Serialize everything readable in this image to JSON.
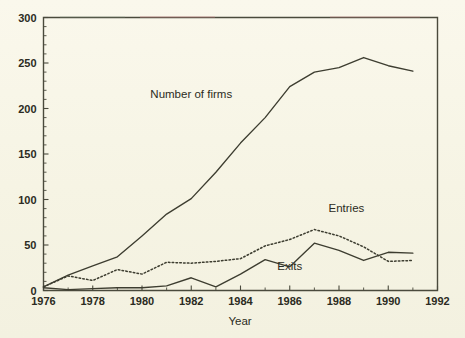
{
  "figure": {
    "background_color": "#f7f5e6",
    "ink_color": "#3d3d30",
    "axis_color": "#4a4a3c"
  },
  "chart_data": {
    "type": "line",
    "title": "",
    "xlabel": "Year",
    "ylabel": "",
    "xlim": [
      1976,
      1992
    ],
    "ylim": [
      0,
      300
    ],
    "grid": false,
    "legend_position": "inline-annotations",
    "x_tick_labels": [
      "1976",
      "1978",
      "1980",
      "1982",
      "1984",
      "1986",
      "1988",
      "1990",
      "1992"
    ],
    "x_tick_values": [
      1976,
      1978,
      1980,
      1982,
      1984,
      1986,
      1988,
      1990,
      1992
    ],
    "x_minor_tick_values": [
      1977,
      1979,
      1981,
      1983,
      1985,
      1987,
      1989,
      1991
    ],
    "y_tick_labels": [
      "0",
      "50",
      "100",
      "150",
      "200",
      "250",
      "300"
    ],
    "y_tick_values": [
      0,
      50,
      100,
      150,
      200,
      250,
      300
    ],
    "y_minor_tick_values": [
      10,
      20,
      30,
      40,
      60,
      70,
      80,
      90,
      110,
      120,
      130,
      140,
      160,
      170,
      180,
      190,
      210,
      220,
      230,
      240,
      260,
      270,
      280,
      290
    ],
    "x": [
      1976,
      1977,
      1978,
      1979,
      1980,
      1981,
      1982,
      1983,
      1984,
      1985,
      1986,
      1987,
      1988,
      1989,
      1990,
      1991
    ],
    "series": [
      {
        "name": "Number of firms",
        "style": "solid",
        "label": "Number of firms",
        "label_x": 1982.0,
        "label_y": 212,
        "values": [
          4,
          17,
          27,
          37,
          60,
          84,
          101,
          130,
          162,
          190,
          224,
          240,
          245,
          256,
          247,
          241
        ]
      },
      {
        "name": "Entries",
        "style": "dotted",
        "label": "Entries",
        "label_x": 1988.3,
        "label_y": 86,
        "values": [
          4,
          16,
          11,
          23,
          18,
          31,
          30,
          32,
          35,
          49,
          56,
          67,
          60,
          48,
          32,
          33
        ]
      },
      {
        "name": "Exits",
        "style": "solid",
        "label": "Exits",
        "label_x": 1986.0,
        "label_y": 22,
        "values": [
          3,
          1,
          2,
          3,
          3,
          5,
          14,
          4,
          18,
          34,
          26,
          52,
          44,
          33,
          42,
          41
        ]
      }
    ]
  }
}
